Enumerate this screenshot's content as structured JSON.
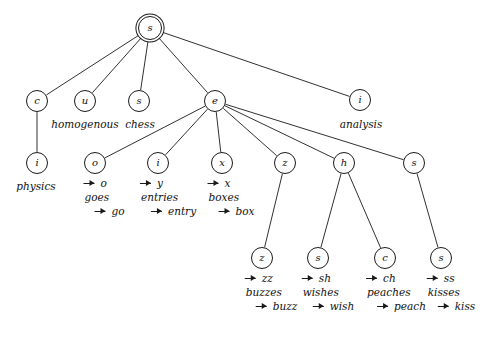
{
  "diagram": {
    "type": "tree",
    "background_color": "#ffffff",
    "stroke_color": "#1a1a1a",
    "node_radius": 11,
    "root_radius": 12
  },
  "nodes": [
    {
      "id": "root",
      "label": "s",
      "x": 150,
      "y": 28,
      "r": 12,
      "root": true
    },
    {
      "id": "c",
      "label": "c",
      "x": 37,
      "y": 101,
      "r": 11,
      "root": false
    },
    {
      "id": "u",
      "label": "u",
      "x": 85,
      "y": 101,
      "r": 11,
      "root": false
    },
    {
      "id": "s2",
      "label": "s",
      "x": 139,
      "y": 101,
      "r": 11,
      "root": false
    },
    {
      "id": "e",
      "label": "e",
      "x": 215,
      "y": 101,
      "r": 11,
      "root": false
    },
    {
      "id": "i_top",
      "label": "i",
      "x": 360,
      "y": 100,
      "r": 11,
      "root": false
    },
    {
      "id": "i_physics",
      "label": "i",
      "x": 37,
      "y": 163,
      "r": 11,
      "root": false
    },
    {
      "id": "o",
      "label": "o",
      "x": 95,
      "y": 163,
      "r": 11,
      "root": false
    },
    {
      "id": "i_entries",
      "label": "i",
      "x": 158,
      "y": 163,
      "r": 11,
      "root": false
    },
    {
      "id": "x",
      "label": "x",
      "x": 222,
      "y": 163,
      "r": 11,
      "root": false
    },
    {
      "id": "z",
      "label": "z",
      "x": 285,
      "y": 163,
      "r": 11,
      "root": false
    },
    {
      "id": "h",
      "label": "h",
      "x": 344,
      "y": 163,
      "r": 11,
      "root": false
    },
    {
      "id": "s_right",
      "label": "s",
      "x": 414,
      "y": 163,
      "r": 11,
      "root": false
    },
    {
      "id": "z_buzz",
      "label": "z",
      "x": 262,
      "y": 258,
      "r": 11,
      "root": false
    },
    {
      "id": "s_wish",
      "label": "s",
      "x": 318,
      "y": 258,
      "r": 11,
      "root": false
    },
    {
      "id": "c_peach",
      "label": "c",
      "x": 385,
      "y": 258,
      "r": 11,
      "root": false
    },
    {
      "id": "s_kiss",
      "label": "s",
      "x": 441,
      "y": 258,
      "r": 11,
      "root": false
    }
  ],
  "edges": [
    {
      "from": "root",
      "to": "c"
    },
    {
      "from": "root",
      "to": "u"
    },
    {
      "from": "root",
      "to": "s2"
    },
    {
      "from": "root",
      "to": "e"
    },
    {
      "from": "root",
      "to": "i_top"
    },
    {
      "from": "c",
      "to": "i_physics"
    },
    {
      "from": "e",
      "to": "o"
    },
    {
      "from": "e",
      "to": "i_entries"
    },
    {
      "from": "e",
      "to": "x"
    },
    {
      "from": "e",
      "to": "z"
    },
    {
      "from": "e",
      "to": "h"
    },
    {
      "from": "e",
      "to": "s_right"
    },
    {
      "from": "z",
      "to": "z_buzz"
    },
    {
      "from": "h",
      "to": "s_wish"
    },
    {
      "from": "h",
      "to": "c_peach"
    },
    {
      "from": "s_right",
      "to": "s_kiss"
    }
  ],
  "word_labels": [
    {
      "id": "homogenous",
      "text": "homogenous",
      "x": 85,
      "y": 118
    },
    {
      "id": "chess",
      "text": "chess",
      "x": 140,
      "y": 118
    },
    {
      "id": "analysis",
      "text": "analysis",
      "x": 361,
      "y": 118
    },
    {
      "id": "physics",
      "text": "physics",
      "x": 36,
      "y": 180
    }
  ],
  "rules": [
    {
      "id": "rule-goes",
      "x": 104,
      "y": 178,
      "lines": [
        {
          "text": "o",
          "arrow": true,
          "indented": false
        },
        {
          "text": "goes",
          "arrow": false,
          "indented": false
        },
        {
          "text": "go",
          "arrow": true,
          "indented": true
        }
      ]
    },
    {
      "id": "rule-entries",
      "x": 168,
      "y": 178,
      "lines": [
        {
          "text": "y",
          "arrow": true,
          "indented": false
        },
        {
          "text": "entries",
          "arrow": false,
          "indented": false
        },
        {
          "text": "entry",
          "arrow": true,
          "indented": true
        }
      ]
    },
    {
      "id": "rule-boxes",
      "x": 231,
      "y": 178,
      "lines": [
        {
          "text": "x",
          "arrow": true,
          "indented": false
        },
        {
          "text": "boxes",
          "arrow": false,
          "indented": false
        },
        {
          "text": "box",
          "arrow": true,
          "indented": true
        }
      ]
    },
    {
      "id": "rule-buzzes",
      "x": 271,
      "y": 273,
      "lines": [
        {
          "text": "zz",
          "arrow": true,
          "indented": false
        },
        {
          "text": "buzzes",
          "arrow": false,
          "indented": false
        },
        {
          "text": "buzz",
          "arrow": true,
          "indented": true
        }
      ]
    },
    {
      "id": "rule-wishes",
      "x": 328,
      "y": 273,
      "lines": [
        {
          "text": "sh",
          "arrow": true,
          "indented": false
        },
        {
          "text": "wishes",
          "arrow": false,
          "indented": false
        },
        {
          "text": "wish",
          "arrow": true,
          "indented": true
        }
      ]
    },
    {
      "id": "rule-peaches",
      "x": 396,
      "y": 273,
      "lines": [
        {
          "text": "ch",
          "arrow": true,
          "indented": false
        },
        {
          "text": "peaches",
          "arrow": false,
          "indented": false
        },
        {
          "text": "peach",
          "arrow": true,
          "indented": true
        }
      ]
    },
    {
      "id": "rule-kisses",
      "x": 451,
      "y": 273,
      "lines": [
        {
          "text": "ss",
          "arrow": true,
          "indented": false
        },
        {
          "text": "kisses",
          "arrow": false,
          "indented": false
        },
        {
          "text": "kiss",
          "arrow": true,
          "indented": true
        }
      ]
    }
  ]
}
